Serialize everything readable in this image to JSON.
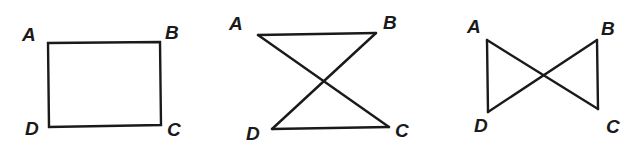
{
  "figures": [
    {
      "name": "rectangle",
      "shape": "quadrilateral ABCD",
      "labels": {
        "A": "A",
        "B": "B",
        "C": "C",
        "D": "D"
      },
      "vertices": {
        "A": [
          48,
          43
        ],
        "B": [
          160,
          42
        ],
        "C": [
          161,
          125
        ],
        "D": [
          49,
          127
        ]
      },
      "edges": [
        [
          "A",
          "B"
        ],
        [
          "B",
          "C"
        ],
        [
          "C",
          "D"
        ],
        [
          "D",
          "A"
        ]
      ]
    },
    {
      "name": "hourglass",
      "shape": "crossed quadrilateral ABCD (hourglass)",
      "labels": {
        "A": "A",
        "B": "B",
        "C": "C",
        "D": "D"
      },
      "vertices": {
        "A": [
          258,
          35
        ],
        "B": [
          376,
          33
        ],
        "C": [
          389,
          127
        ],
        "D": [
          272,
          129
        ]
      },
      "edges": [
        [
          "A",
          "B"
        ],
        [
          "B",
          "D"
        ],
        [
          "D",
          "C"
        ],
        [
          "C",
          "A"
        ]
      ]
    },
    {
      "name": "bowtie",
      "shape": "crossed quadrilateral ABCD (bowtie)",
      "labels": {
        "A": "A",
        "B": "B",
        "C": "C",
        "D": "D"
      },
      "vertices": {
        "A": [
          487,
          40
        ],
        "B": [
          597,
          40
        ],
        "C": [
          598,
          109
        ],
        "D": [
          488,
          112
        ]
      },
      "edges": [
        [
          "A",
          "D"
        ],
        [
          "D",
          "B"
        ],
        [
          "B",
          "C"
        ],
        [
          "C",
          "A"
        ]
      ]
    }
  ]
}
